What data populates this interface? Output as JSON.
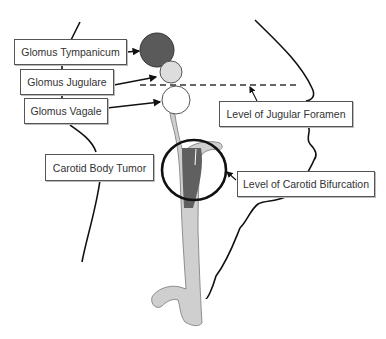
{
  "diagram": {
    "type": "anatomical-schematic",
    "labels": {
      "glomus_tympanicum": "Glomus Tympanicum",
      "glomus_jugulare": "Glomus Jugulare",
      "glomus_vagale": "Glomus Vagale",
      "carotid_body_tumor": "Carotid Body Tumor",
      "level_jugular_foramen": "Level of Jugular Foramen",
      "level_carotid_bifurcation": "Level of Carotid Bifurcation"
    },
    "colors": {
      "tympanicum_fill": "#5a5a5a",
      "jugulare_fill": "#dddddd",
      "vagale_fill": "#ffffff",
      "vessel_fill": "#cfcfcf",
      "carotid_tumor_fill": "#606060",
      "outline": "#111111"
    }
  }
}
